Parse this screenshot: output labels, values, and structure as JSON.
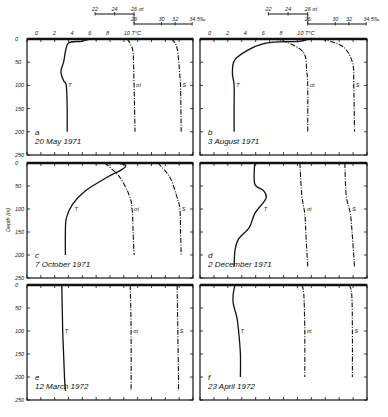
{
  "chart_data": {
    "type": "line",
    "title": "",
    "ylabel": "Depth (m)",
    "y_ticks": [
      "0",
      "50",
      "100",
      "150",
      "200",
      "250"
    ],
    "ylim": [
      0,
      250
    ],
    "x_scales": {
      "temperature": {
        "label": "°C",
        "ticks": [
          "0",
          "2",
          "4",
          "6",
          "8",
          "10"
        ],
        "end_label": "10 T°C",
        "range": [
          0,
          12
        ]
      },
      "sigma_t": {
        "label": "σt",
        "ticks": [
          "22",
          "24",
          "26 σt"
        ],
        "range": [
          22,
          26
        ]
      },
      "salinity": {
        "label": "S‰",
        "ticks": [
          "26",
          "30",
          "32",
          "34.5‰"
        ],
        "range": [
          26,
          34.5
        ]
      }
    },
    "series_labels": {
      "T": "T",
      "sigma": "σt",
      "S": "S"
    },
    "panels": [
      {
        "id": "a",
        "date": "20 May 1971",
        "T": [
          [
            6,
            0
          ],
          [
            5,
            5
          ],
          [
            3.5,
            10
          ],
          [
            3,
            50
          ],
          [
            2.7,
            70
          ],
          [
            3,
            90
          ],
          [
            3.3,
            100
          ],
          [
            3.4,
            150
          ],
          [
            3.4,
            200
          ]
        ],
        "sigma_t": [
          [
            25.3,
            0
          ],
          [
            25.6,
            10
          ],
          [
            25.9,
            30
          ],
          [
            26.0,
            100
          ],
          [
            26.1,
            200
          ]
        ],
        "S": [
          [
            31.5,
            0
          ],
          [
            32.3,
            20
          ],
          [
            32.7,
            80
          ],
          [
            32.8,
            100
          ],
          [
            32.9,
            200
          ]
        ]
      },
      {
        "id": "b",
        "date": "3 August 1971",
        "T": [
          [
            11,
            0
          ],
          [
            10,
            5
          ],
          [
            6,
            10
          ],
          [
            3,
            40
          ],
          [
            2.5,
            70
          ],
          [
            2.7,
            100
          ],
          [
            2.7,
            150
          ],
          [
            2.7,
            200
          ]
        ],
        "sigma_t": [
          [
            22.5,
            0
          ],
          [
            24,
            8
          ],
          [
            25.6,
            30
          ],
          [
            25.9,
            70
          ],
          [
            26.0,
            100
          ],
          [
            26.0,
            200
          ]
        ],
        "S": [
          [
            28,
            0
          ],
          [
            31,
            15
          ],
          [
            32.5,
            50
          ],
          [
            32.7,
            100
          ],
          [
            32.8,
            200
          ]
        ]
      },
      {
        "id": "c",
        "date": "7 October 1971",
        "T": [
          [
            9,
            0
          ],
          [
            10,
            5
          ],
          [
            9.5,
            15
          ],
          [
            8,
            30
          ],
          [
            5.5,
            60
          ],
          [
            4,
            90
          ],
          [
            3.3,
            120
          ],
          [
            3.2,
            150
          ],
          [
            3.2,
            200
          ]
        ],
        "sigma_t": [
          [
            23,
            0
          ],
          [
            24.5,
            30
          ],
          [
            25.5,
            70
          ],
          [
            25.8,
            100
          ],
          [
            25.9,
            150
          ],
          [
            26.0,
            200
          ]
        ],
        "S": [
          [
            29.5,
            0
          ],
          [
            31.2,
            30
          ],
          [
            32.2,
            70
          ],
          [
            32.7,
            100
          ],
          [
            32.8,
            150
          ],
          [
            32.9,
            200
          ]
        ]
      },
      {
        "id": "d",
        "date": "2 December 1971",
        "T": [
          [
            5,
            0
          ],
          [
            5,
            45
          ],
          [
            6,
            60
          ],
          [
            6.3,
            75
          ],
          [
            5.8,
            90
          ],
          [
            5,
            110
          ],
          [
            4.4,
            140
          ],
          [
            3.2,
            165
          ],
          [
            2.8,
            190
          ],
          [
            2.7,
            225
          ]
        ],
        "sigma_t": [
          [
            25.2,
            0
          ],
          [
            25.4,
            70
          ],
          [
            25.7,
            110
          ],
          [
            25.8,
            150
          ],
          [
            26.0,
            225
          ]
        ],
        "S": [
          [
            31.4,
            0
          ],
          [
            31.6,
            70
          ],
          [
            32.2,
            110
          ],
          [
            32.5,
            160
          ],
          [
            32.8,
            225
          ]
        ]
      },
      {
        "id": "e",
        "date": "12 March 1972",
        "T": [
          [
            2.8,
            0
          ],
          [
            2.9,
            100
          ],
          [
            3.0,
            150
          ],
          [
            3.1,
            200
          ],
          [
            3.2,
            230
          ]
        ],
        "sigma_t": [
          [
            25.6,
            0
          ],
          [
            25.7,
            100
          ],
          [
            25.7,
            230
          ]
        ],
        "S": [
          [
            32.3,
            0
          ],
          [
            32.4,
            100
          ],
          [
            32.5,
            200
          ],
          [
            32.5,
            230
          ]
        ]
      },
      {
        "id": "f",
        "date": "23 April 1972",
        "T": [
          [
            2.8,
            0
          ],
          [
            2.6,
            20
          ],
          [
            2.6,
            40
          ],
          [
            3.0,
            70
          ],
          [
            3.2,
            100
          ],
          [
            3.4,
            150
          ],
          [
            3.4,
            200
          ]
        ],
        "sigma_t": [
          [
            25.4,
            0
          ],
          [
            25.6,
            20
          ],
          [
            25.7,
            100
          ],
          [
            25.7,
            200
          ]
        ],
        "S": [
          [
            32.0,
            0
          ],
          [
            32.4,
            20
          ],
          [
            32.5,
            100
          ],
          [
            32.5,
            200
          ]
        ]
      }
    ]
  },
  "captions": {
    "a_letter": "a",
    "a_date": "20 May 1971",
    "b_letter": "b",
    "b_date": "3 August 1971",
    "c_letter": "c",
    "c_date": "7 October 1971",
    "d_letter": "d",
    "d_date": "2 December 1971",
    "e_letter": "e",
    "e_date": "12 March 1972",
    "f_letter": "f",
    "f_date": "23 April 1972"
  },
  "axis": {
    "ylabel": "Depth (m)",
    "temp_ticks": [
      "0",
      "2",
      "4",
      "6",
      "8",
      "10 T°C"
    ],
    "sigma_ticks": [
      "22",
      "24",
      "26 σt"
    ],
    "sal_ticks": [
      "26",
      "30",
      "32",
      "34.5‰"
    ],
    "depth_ticks": [
      "0",
      "50",
      "100",
      "150",
      "200",
      "250"
    ]
  },
  "curve_labels": {
    "T": "T",
    "sigma": "σt",
    "S": "S"
  }
}
